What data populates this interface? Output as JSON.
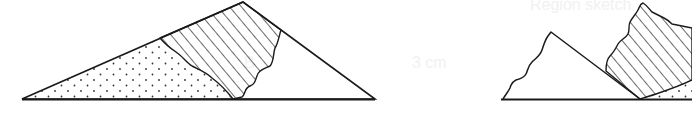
{
  "figure": {
    "type": "cross-section diagram",
    "panels": [
      {
        "name": "left-triangle",
        "regions": [
          "dotted",
          "hatched",
          "blank"
        ]
      },
      {
        "name": "right-fragment",
        "regions": [
          "blank",
          "hatched",
          "dotted"
        ]
      }
    ],
    "bleed_text": {
      "title": "Region sketch",
      "measure": "3 cm",
      "label": "B"
    },
    "colors": {
      "stroke": "#1a1a1a",
      "background": "#ffffff",
      "bleed": "#efefef"
    }
  }
}
